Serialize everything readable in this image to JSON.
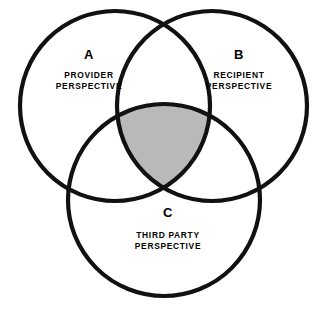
{
  "diagram": {
    "type": "venn-three-set",
    "background_color": "#ffffff",
    "stroke_color": "#111111",
    "intersection_fill_color": "#b9b9b9",
    "sets": [
      {
        "id": "A",
        "letter": "A",
        "caption_line1": "PROVIDER",
        "caption_line2": "PERSPECTIVE",
        "cx": 115,
        "cy": 106,
        "r": 95
      },
      {
        "id": "B",
        "letter": "B",
        "caption_line1": "RECIPIENT",
        "caption_line2": "PERSPECTIVE",
        "cx": 212,
        "cy": 106,
        "r": 95
      },
      {
        "id": "C",
        "letter": "C",
        "caption_line1": "THIRD PARTY",
        "caption_line2": "PERSPECTIVE",
        "cx": 164,
        "cy": 200,
        "r": 96
      }
    ],
    "labels": {
      "a_letter_x": 89,
      "a_letter_y": 59,
      "a_line1_x": 89,
      "a_line1_y": 78,
      "a_line2_x": 89,
      "a_line2_y": 89,
      "b_letter_x": 239,
      "b_letter_y": 59,
      "b_line1_x": 239,
      "b_line1_y": 78,
      "b_line2_x": 239,
      "b_line2_y": 89,
      "c_letter_x": 168,
      "c_letter_y": 217,
      "c_line1_x": 168,
      "c_line1_y": 238,
      "c_line2_x": 168,
      "c_line2_y": 249
    }
  }
}
